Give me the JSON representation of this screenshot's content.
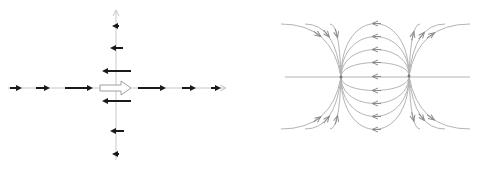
{
  "figure": {
    "panels": [
      {
        "id": "left",
        "description": "Dipole field along axes: hollow dipole-moment arrow at origin, field arrows along x-axis point +x, along y-axis point -x",
        "origin": [
          116,
          88
        ],
        "axis_color": "#c8c8c8",
        "arrow_color": "#1a1a1a",
        "dipole_arrow_color": "#a0a0a0",
        "x_axis": {
          "from": 8,
          "to": 226
        },
        "y_axis": {
          "from": 160,
          "to": 10
        },
        "x_axis_arrows": [
          {
            "x1": 10,
            "x2": 22
          },
          {
            "x1": 36,
            "x2": 50
          },
          {
            "x1": 65,
            "x2": 93
          },
          {
            "x1": 138,
            "x2": 166
          },
          {
            "x1": 182,
            "x2": 196
          },
          {
            "x1": 211,
            "x2": 221
          }
        ],
        "y_axis_arrows": [
          {
            "y": 26,
            "x1": 119,
            "x2": 112
          },
          {
            "y": 48,
            "x1": 123,
            "x2": 110
          },
          {
            "y": 71,
            "x1": 131,
            "x2": 102
          },
          {
            "y": 101,
            "x1": 131,
            "x2": 102
          },
          {
            "y": 131,
            "x1": 124,
            "x2": 110
          },
          {
            "y": 154,
            "x1": 119,
            "x2": 112
          }
        ],
        "dipole_arrow": {
          "x1": 100,
          "x2": 131,
          "y": 88
        }
      },
      {
        "id": "right",
        "description": "Electric field lines of an electric dipole with two point charges",
        "line_color": "#b4b4b4",
        "arrow_color": "#8c8c8c",
        "charge_left": [
          341,
          77
        ],
        "charge_right": [
          409,
          76
        ],
        "axis": {
          "from": 285,
          "to": 470,
          "y": 77
        },
        "inner_arc_heights": [
          53,
          40,
          27,
          14,
          -14,
          -27,
          -40,
          -53
        ],
        "outer_lines": {
          "left_top_ends": [
            [
              281,
              24
            ],
            [
              305,
              24
            ],
            [
              330,
              24
            ]
          ],
          "left_bottom_ends": [
            [
              281,
              129
            ],
            [
              305,
              129
            ],
            [
              330,
              129
            ]
          ],
          "right_top_ends": [
            [
              420,
              24
            ],
            [
              445,
              24
            ],
            [
              470,
              24
            ]
          ],
          "right_bottom_ends": [
            [
              420,
              129
            ],
            [
              445,
              129
            ],
            [
              470,
              129
            ]
          ]
        }
      }
    ]
  }
}
